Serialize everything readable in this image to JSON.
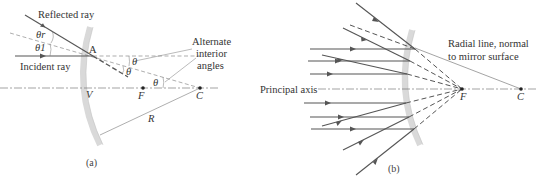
{
  "figure": {
    "panel_a": {
      "caption": "(a)",
      "labels": {
        "reflected_ray": "Reflected ray",
        "incident_ray": "Incident ray",
        "theta_r": "θr",
        "theta_1": "θ1",
        "point_A": "A",
        "vertex": "V",
        "focal_point": "F",
        "center": "C",
        "radius": "R",
        "theta": "θ",
        "alternate_angles_line1": "Alternate",
        "alternate_angles_line2": "interior",
        "alternate_angles_line3": "angles"
      }
    },
    "panel_b": {
      "caption": "(b)",
      "labels": {
        "principal_axis": "Principal axis",
        "radial_line_line1": "Radial line, normal",
        "radial_line_line2": "to mirror surface",
        "focal_point": "F",
        "center": "C"
      }
    },
    "colors": {
      "ray": "#555555",
      "mirror": "#d8d8d8",
      "text": "#333333"
    }
  }
}
